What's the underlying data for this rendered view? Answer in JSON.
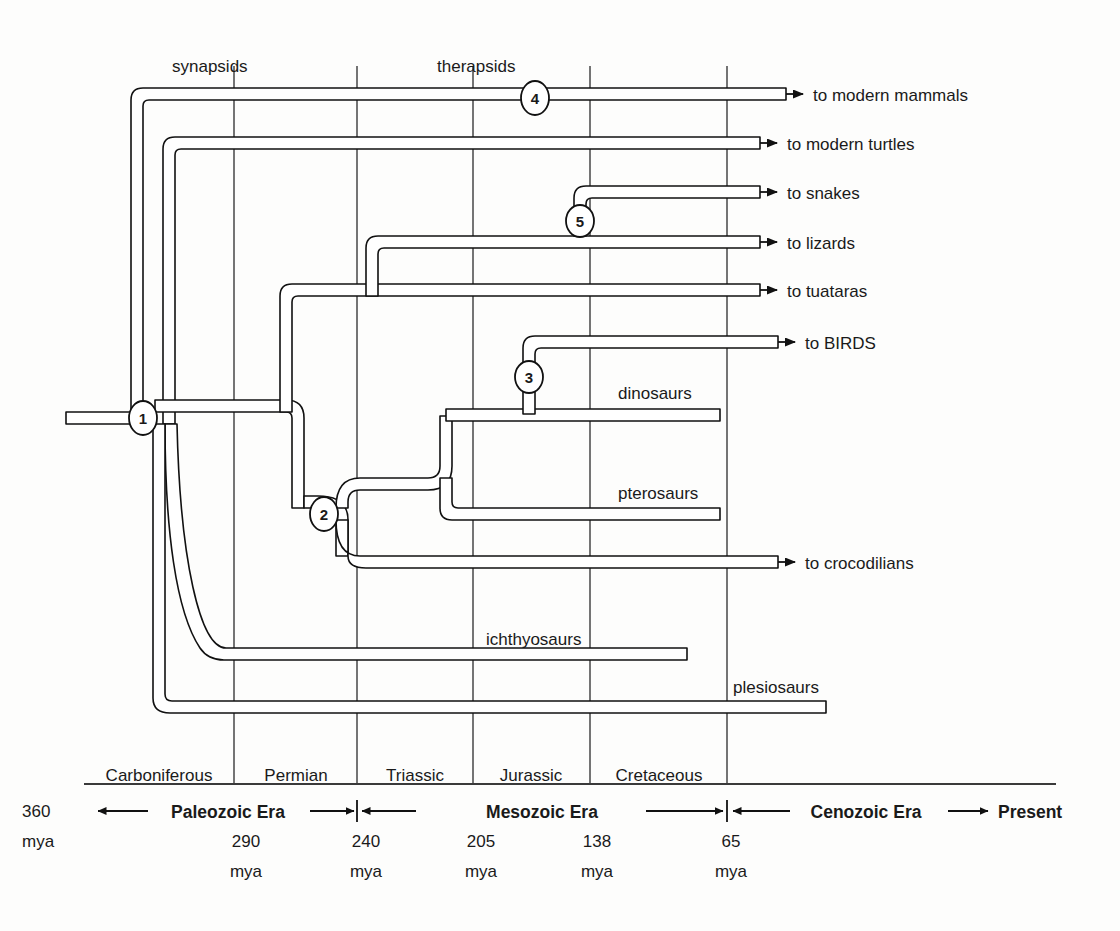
{
  "figure": {
    "type": "phylogeny-timeline",
    "title": "",
    "background": "#fdfdfc",
    "line_color": "#111111"
  },
  "top_labels": [
    {
      "text": "synapsids",
      "x": 214,
      "y": 66
    },
    {
      "text": "therapsids",
      "x": 482,
      "y": 66
    }
  ],
  "tips": [
    {
      "id": "mammals",
      "label": "to modern mammals",
      "y": 94
    },
    {
      "id": "turtles",
      "label": "to modern turtles",
      "y": 143
    },
    {
      "id": "snakes",
      "label": "to snakes",
      "y": 192
    },
    {
      "id": "lizards",
      "label": "to lizards",
      "y": 242
    },
    {
      "id": "tuataras",
      "label": "to tuataras",
      "y": 290
    },
    {
      "id": "birds",
      "label": "to BIRDS",
      "y": 340
    },
    {
      "id": "crocodilians",
      "label": "to crocodilians",
      "y": 560
    }
  ],
  "extinct_groups": [
    {
      "id": "dinosaurs",
      "label": "dinosaurs",
      "label_x": 618,
      "label_y": 392,
      "bar_y": 414,
      "bar_end_x": 720
    },
    {
      "id": "pterosaurs",
      "label": "pterosaurs",
      "label_x": 618,
      "label_y": 492,
      "bar_y": 513,
      "bar_end_x": 720
    },
    {
      "id": "ichthyosaurs",
      "label": "ichthyosaurs",
      "label_x": 486,
      "label_y": 638,
      "bar_y": 654,
      "bar_end_x": 687
    },
    {
      "id": "plesiosaurs",
      "label": "plesiosaurs",
      "label_x": 733,
      "label_y": 686,
      "bar_y": 707,
      "bar_end_x": 826
    }
  ],
  "nodes": [
    {
      "number": "1",
      "x": 143,
      "y": 418
    },
    {
      "number": "2",
      "x": 324,
      "y": 514
    },
    {
      "number": "3",
      "x": 529,
      "y": 377
    },
    {
      "number": "4",
      "x": 535,
      "y": 98
    },
    {
      "number": "5",
      "x": 580,
      "y": 221
    }
  ],
  "periods": [
    {
      "name": "Carboniferous",
      "x_start": 84,
      "x_end": 234
    },
    {
      "name": "Permian",
      "x_start": 234,
      "x_end": 357
    },
    {
      "name": "Triassic",
      "x_start": 357,
      "x_end": 473
    },
    {
      "name": "Jurassic",
      "x_start": 473,
      "x_end": 590
    },
    {
      "name": "Cretaceous",
      "x_start": 590,
      "x_end": 727
    }
  ],
  "gridlines_x": [
    234,
    357,
    473,
    590,
    727
  ],
  "eras": [
    {
      "name": "Paleozoic Era",
      "x_start": 98,
      "x_end": 357,
      "label_x": 228
    },
    {
      "name": "Mesozoic Era",
      "x_start": 357,
      "x_end": 727,
      "label_x": 542
    },
    {
      "name": "Cenozoic Era",
      "x_start": 727,
      "x_end": 988,
      "label_x": 866
    }
  ],
  "axis": {
    "start_label": "360",
    "start_label_unit": "mya",
    "start_label_x": 44,
    "end_label": "Present",
    "end_label_x": 1000,
    "baseline_y": 784,
    "era_axis_y": 810
  },
  "boundary_ticks": [
    {
      "value": "290",
      "unit": "mya",
      "x": 234
    },
    {
      "value": "240",
      "unit": "mya",
      "x": 357
    },
    {
      "value": "205",
      "unit": "mya",
      "x": 473
    },
    {
      "value": "138",
      "unit": "mya",
      "x": 590
    },
    {
      "value": "65",
      "unit": "mya",
      "x": 727
    }
  ]
}
